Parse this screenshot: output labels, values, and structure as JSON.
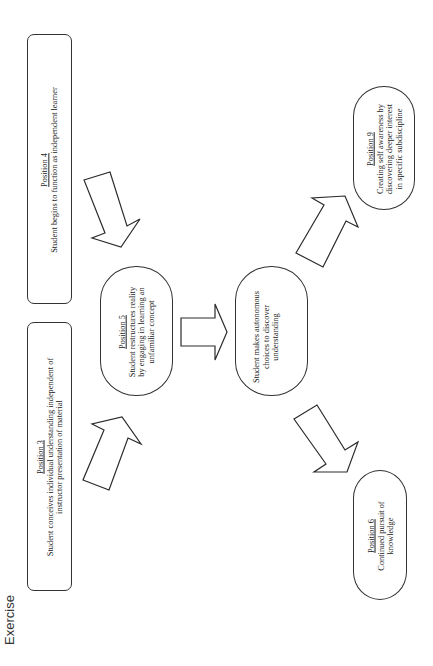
{
  "page": {
    "label": "Exercise",
    "orientation": "rotated -90deg (text reads bottom-to-top)"
  },
  "nodes": {
    "position4": {
      "title": "Position 4",
      "lines": [
        "Student begins to function as independent learner"
      ]
    },
    "position3": {
      "title": "Position 3",
      "lines": [
        "Student conceives individual understanding independent of",
        "instructor presentation of material"
      ]
    },
    "position5": {
      "title": "Position 5",
      "lines": [
        "Student restructures reality",
        "by engaging in learning an",
        "unfamiliar concept"
      ]
    },
    "autonomous": {
      "title": "",
      "lines": [
        "Student makes autonomous",
        "choices to discover",
        "understanding"
      ]
    },
    "position9": {
      "title": "Position 9",
      "lines": [
        "Creating self awareness by",
        "discovering deeper interest",
        "in specific subdiscipline"
      ]
    },
    "position6": {
      "title": "Position 6",
      "lines": [
        "Continued pursuit of",
        "knowledge"
      ]
    }
  },
  "edges": [
    {
      "from": "Position 4",
      "to": "Position 5"
    },
    {
      "from": "Position 3",
      "to": "Position 5"
    },
    {
      "from": "Position 5",
      "to": "Student makes autonomous choices"
    },
    {
      "from": "Student makes autonomous choices",
      "to": "Position 9"
    },
    {
      "from": "Student makes autonomous choices",
      "to": "Position 6"
    }
  ],
  "colors": {
    "stroke": "#333333",
    "background": "#ffffff",
    "text": "#222222"
  }
}
